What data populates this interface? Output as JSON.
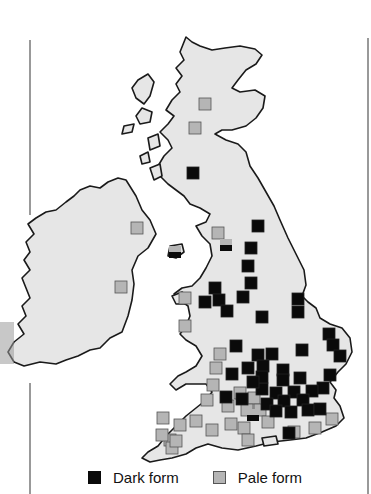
{
  "figure": {
    "type": "distribution-map",
    "region": "British Isles",
    "colors": {
      "land": "#e6e6e6",
      "coastline": "#1a1a1a",
      "dark_form": "#0a0a0a",
      "pale_form": "#b5b5b5"
    }
  },
  "legend": {
    "items": [
      {
        "label": "Dark form",
        "color": "#0a0a0a",
        "icon": "dark-square"
      },
      {
        "label": "Pale form",
        "color": "#b5b5b5",
        "icon": "pale-square"
      }
    ]
  },
  "markers": {
    "pale": [
      [
        205,
        104
      ],
      [
        195,
        128
      ],
      [
        137,
        228
      ],
      [
        121,
        287
      ],
      [
        185,
        298
      ],
      [
        185,
        326
      ],
      [
        218,
        233
      ],
      [
        220,
        354
      ],
      [
        216,
        368
      ],
      [
        213,
        385
      ],
      [
        207,
        400
      ],
      [
        240,
        393
      ],
      [
        254,
        398
      ],
      [
        228,
        406
      ],
      [
        247,
        410
      ],
      [
        260,
        410
      ],
      [
        268,
        422
      ],
      [
        244,
        428
      ],
      [
        231,
        424
      ],
      [
        212,
        430
      ],
      [
        196,
        421
      ],
      [
        163,
        418
      ],
      [
        180,
        425
      ],
      [
        170,
        440
      ],
      [
        162,
        435
      ],
      [
        172,
        448
      ],
      [
        176,
        441
      ],
      [
        248,
        440
      ],
      [
        294,
        432
      ],
      [
        315,
        428
      ],
      [
        332,
        419
      ]
    ],
    "dark": [
      [
        193,
        173
      ],
      [
        258,
        226
      ],
      [
        251,
        248
      ],
      [
        248,
        266
      ],
      [
        251,
        283
      ],
      [
        215,
        288
      ],
      [
        219,
        300
      ],
      [
        205,
        302
      ],
      [
        227,
        311
      ],
      [
        243,
        297
      ],
      [
        262,
        317
      ],
      [
        298,
        299
      ],
      [
        298,
        312
      ],
      [
        302,
        350
      ],
      [
        329,
        334
      ],
      [
        333,
        345
      ],
      [
        340,
        356
      ],
      [
        236,
        346
      ],
      [
        258,
        355
      ],
      [
        272,
        354
      ],
      [
        248,
        368
      ],
      [
        263,
        366
      ],
      [
        283,
        370
      ],
      [
        300,
        378
      ],
      [
        330,
        375
      ],
      [
        323,
        388
      ],
      [
        312,
        391
      ],
      [
        294,
        392
      ],
      [
        276,
        393
      ],
      [
        262,
        389
      ],
      [
        242,
        399
      ],
      [
        267,
        404
      ],
      [
        284,
        401
      ],
      [
        303,
        400
      ],
      [
        308,
        410
      ],
      [
        291,
        412
      ],
      [
        276,
        411
      ],
      [
        283,
        380
      ],
      [
        232,
        374
      ],
      [
        226,
        397
      ],
      [
        262,
        377
      ],
      [
        253,
        382
      ],
      [
        320,
        409
      ],
      [
        289,
        433
      ]
    ],
    "split": [
      [
        175,
        252
      ],
      [
        226,
        245
      ],
      [
        253,
        415
      ]
    ]
  }
}
